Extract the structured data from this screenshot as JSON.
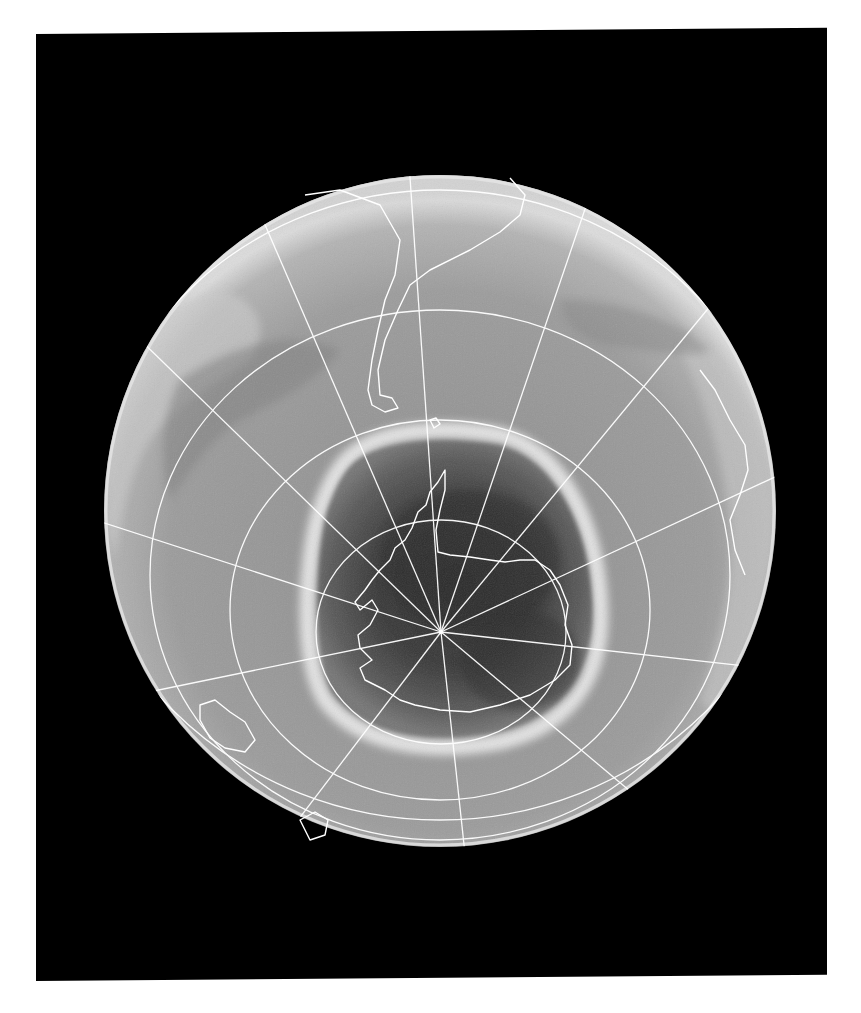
{
  "image": {
    "kind": "satellite-ozone-map",
    "view": "southern-hemisphere-orthographic",
    "background_color": "#000000",
    "page_color": "#ffffff",
    "globe": {
      "cx": 440,
      "cy": 511,
      "r": 336,
      "base_gray": "#9a9a9a",
      "rim_gray": "#d8d8d8"
    },
    "pole": {
      "x": 441,
      "y": 632
    },
    "ozone_hole": {
      "core_color": "#2a2a2a",
      "mid_color": "#555555",
      "collar_color": "#e8e8e8"
    },
    "graticule_color": "#ffffff",
    "coastline_color": "#ffffff",
    "visible_landmasses": [
      "South America",
      "Antarctica",
      "Africa (edge)",
      "Australia (edge)",
      "New Zealand"
    ]
  }
}
